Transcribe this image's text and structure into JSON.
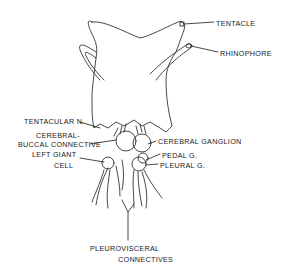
{
  "diagram": {
    "labels": {
      "tentacle": "TENTACLE",
      "rhinophore": "RHINOPHORE",
      "tentacular_n": "TENTACULAR N.",
      "cerebral_buccal_1": "CEREBRAL-",
      "cerebral_buccal_2": "BUCCAL CONNECTIVE",
      "cerebral_ganglion": "CEREBRAL GANGLION",
      "left_giant_1": "LEFT GIANT",
      "left_giant_2": "CELL",
      "pedal_g": "PEDAL G.",
      "pleural_g": "PLEURAL G.",
      "pleurovisceral_1": "PLEUROVISCERAL",
      "pleurovisceral_2": "CONNECTIVES"
    },
    "colors": {
      "line": "#1a1a1a",
      "background": "#ffffff"
    }
  }
}
